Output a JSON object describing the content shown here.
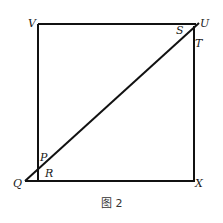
{
  "figure": {
    "caption": "图 2",
    "stroke_color": "#111111",
    "background": "#ffffff"
  },
  "points": {
    "V": "V",
    "U": "U",
    "S": "S",
    "T": "T",
    "P": "P",
    "Q": "Q",
    "R": "R",
    "X": "X"
  },
  "shapes": {
    "square": "VUXR",
    "diagonal": "QU",
    "segments": [
      "VU",
      "UX",
      "XQ",
      "VR",
      "QU"
    ]
  }
}
